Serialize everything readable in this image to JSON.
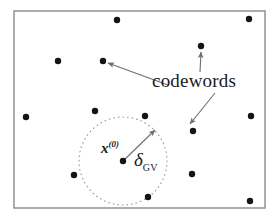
{
  "figure": {
    "width": 276,
    "height": 220,
    "background": "#ffffff",
    "frame": {
      "name": "codeword-space-boundary",
      "x": 14,
      "y": 11,
      "width": 251,
      "height": 197,
      "stroke": "#8a8a8a",
      "fill": "#ffffff",
      "stroke_width": 1.4
    },
    "ball": {
      "name": "gilbert-varshamov-ball",
      "cx": 123,
      "cy": 161,
      "r": 44,
      "stroke": "#9a9a9a",
      "style": "dotted"
    },
    "dot_color": "#141414",
    "dot_radius": 3.2,
    "codewords": [
      {
        "name": "codeword-top-center",
        "x": 117,
        "y": 20
      },
      {
        "name": "codeword-top-right-corner",
        "x": 249,
        "y": 19
      },
      {
        "name": "codeword-upper-right",
        "x": 201,
        "y": 46
      },
      {
        "name": "codeword-left-upper",
        "x": 58,
        "y": 61
      },
      {
        "name": "codeword-center-upper",
        "x": 103,
        "y": 61
      },
      {
        "name": "codeword-far-left",
        "x": 26,
        "y": 117
      },
      {
        "name": "codeword-ball-top-left",
        "x": 95,
        "y": 111
      },
      {
        "name": "codeword-ball-top-right",
        "x": 145,
        "y": 116
      },
      {
        "name": "codeword-right-mid",
        "x": 251,
        "y": 116
      },
      {
        "name": "codeword-right-inner",
        "x": 193,
        "y": 131
      },
      {
        "name": "codeword-center-origin",
        "x": 123,
        "y": 161
      },
      {
        "name": "codeword-ball-left",
        "x": 74,
        "y": 175
      },
      {
        "name": "codeword-lower-right",
        "x": 192,
        "y": 174
      },
      {
        "name": "codeword-ball-bottom",
        "x": 148,
        "y": 197
      },
      {
        "name": "codeword-bottom-right",
        "x": 250,
        "y": 201
      }
    ],
    "arrows": {
      "stroke": "#6e6e6e",
      "stroke_width": 1.1,
      "items": [
        {
          "name": "arrow-codewords-to-upper-left-dot",
          "x1": 168,
          "y1": 85,
          "x2": 108,
          "y2": 63
        },
        {
          "name": "arrow-codewords-to-upper-right-dot",
          "x1": 200,
          "y1": 72,
          "x2": 201,
          "y2": 52
        },
        {
          "name": "arrow-codewords-to-lower-right-dot",
          "x1": 215,
          "y1": 93,
          "x2": 190,
          "y2": 124
        },
        {
          "name": "arrow-radius-delta",
          "x1": 123,
          "y1": 161,
          "x2": 155,
          "y2": 130
        }
      ]
    }
  },
  "labels": {
    "codewords": {
      "text": "codewords",
      "x": 152,
      "y": 71
    },
    "origin_point": {
      "base": "x",
      "superscript": "(0)",
      "x": 101,
      "y": 140
    },
    "ball_radius": {
      "symbol": "δ",
      "subscript": "GV",
      "x": 134,
      "y": 150
    }
  }
}
